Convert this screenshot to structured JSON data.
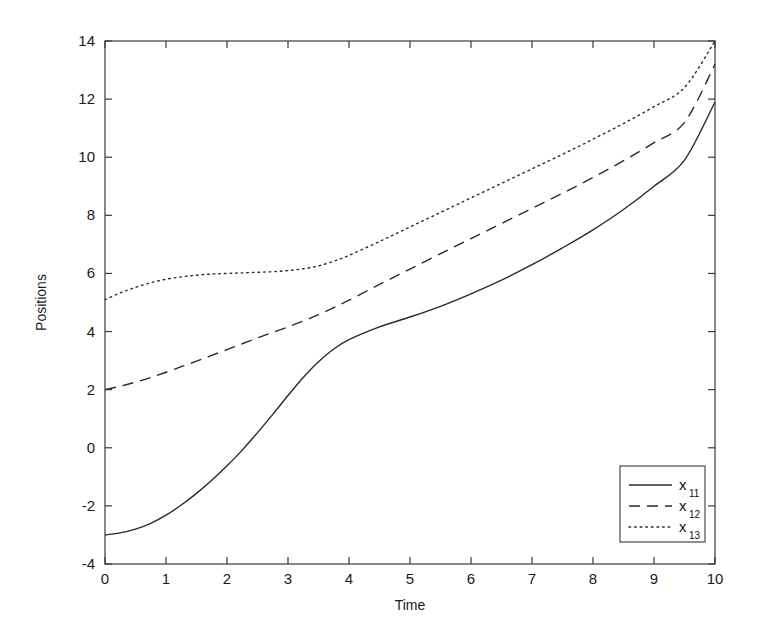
{
  "chart_data": {
    "type": "line",
    "title": "",
    "xlabel": "Time",
    "ylabel": "Positions",
    "xlim": [
      0,
      10
    ],
    "ylim": [
      -4,
      14
    ],
    "xticks": [
      0,
      1,
      2,
      3,
      4,
      5,
      6,
      7,
      8,
      9,
      10
    ],
    "yticks": [
      -4,
      -2,
      0,
      2,
      4,
      6,
      8,
      10,
      12,
      14
    ],
    "xtick_labels": [
      "0",
      "1",
      "2",
      "3",
      "4",
      "5",
      "6",
      "7",
      "8",
      "9",
      "10"
    ],
    "ytick_labels": [
      "-4",
      "-2",
      "0",
      "2",
      "4",
      "6",
      "8",
      "10",
      "12",
      "14"
    ],
    "grid": false,
    "legend_position": "lower right",
    "x": [
      0,
      0.25,
      0.5,
      0.75,
      1,
      1.25,
      1.5,
      1.75,
      2,
      2.25,
      2.5,
      2.75,
      3,
      3.25,
      3.5,
      3.75,
      4,
      4.5,
      5,
      5.5,
      6,
      6.5,
      7,
      7.5,
      8,
      8.5,
      9,
      9.5,
      10
    ],
    "series": [
      {
        "name": "x_11",
        "label": "x",
        "sublabel": "11",
        "linestyle": "solid",
        "color": "#2a2a2a",
        "values": [
          -3.0,
          -2.93,
          -2.8,
          -2.6,
          -2.32,
          -1.97,
          -1.57,
          -1.12,
          -0.62,
          -0.08,
          0.52,
          1.15,
          1.8,
          2.42,
          2.96,
          3.4,
          3.72,
          4.16,
          4.5,
          4.87,
          5.3,
          5.77,
          6.3,
          6.88,
          7.5,
          8.2,
          9.0,
          9.9,
          11.9
        ]
      },
      {
        "name": "x_12",
        "label": "x",
        "sublabel": "12",
        "linestyle": "dashed",
        "color": "#2a2a2a",
        "values": [
          2.0,
          2.12,
          2.26,
          2.42,
          2.6,
          2.79,
          2.98,
          3.18,
          3.38,
          3.58,
          3.78,
          3.97,
          4.16,
          4.36,
          4.58,
          4.82,
          5.08,
          5.62,
          6.15,
          6.68,
          7.2,
          7.72,
          8.24,
          8.76,
          9.3,
          9.88,
          10.5,
          11.2,
          13.2
        ]
      },
      {
        "name": "x_13",
        "label": "x",
        "sublabel": "13",
        "linestyle": "dotted",
        "color": "#2a2a2a",
        "values": [
          5.1,
          5.33,
          5.52,
          5.68,
          5.8,
          5.88,
          5.94,
          5.98,
          6.0,
          6.02,
          6.04,
          6.06,
          6.1,
          6.16,
          6.26,
          6.42,
          6.62,
          7.1,
          7.6,
          8.1,
          8.6,
          9.1,
          9.6,
          10.1,
          10.62,
          11.16,
          11.74,
          12.4,
          14.0
        ]
      }
    ]
  },
  "legend": {
    "entries": [
      {
        "label": "x",
        "sublabel": "11",
        "style": "solid"
      },
      {
        "label": "x",
        "sublabel": "12",
        "style": "dashed"
      },
      {
        "label": "x",
        "sublabel": "13",
        "style": "dotted"
      }
    ]
  }
}
